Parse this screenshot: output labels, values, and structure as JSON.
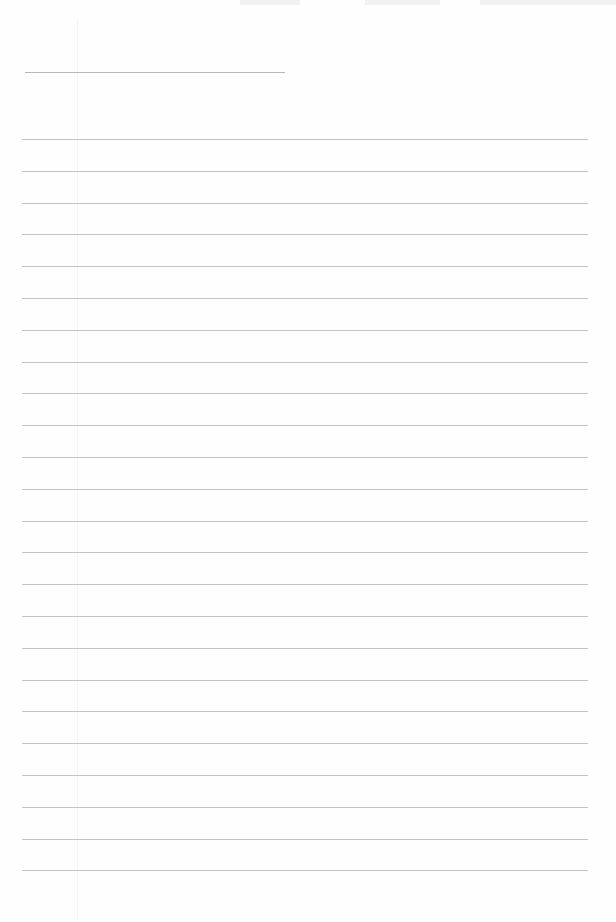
{
  "page": {
    "type": "lined-notepaper",
    "title_line": {
      "text": ""
    },
    "rules": {
      "count": 24,
      "first_y": 139,
      "spacing": 31.8,
      "color": "#c4c4c4"
    },
    "lines": [
      "",
      "",
      "",
      "",
      "",
      "",
      "",
      "",
      "",
      "",
      "",
      "",
      "",
      "",
      "",
      "",
      "",
      "",
      "",
      "",
      "",
      "",
      "",
      ""
    ]
  }
}
